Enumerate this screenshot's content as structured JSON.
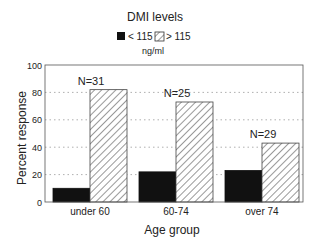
{
  "chart_data": {
    "type": "bar",
    "title": "DMI levels",
    "legend_unit": "ng/ml",
    "xlabel": "Age group",
    "ylabel": "Percent response",
    "ylim": [
      0,
      100
    ],
    "yticks": [
      0,
      20,
      40,
      60,
      80,
      100
    ],
    "grid": "horizontal dotted at 20, 40, 60, 80",
    "legend_position": "top center",
    "categories": [
      "under 60",
      "60-74",
      "over 74"
    ],
    "series": [
      {
        "name": "< 115",
        "fill": "solid",
        "color": "#111111",
        "values": [
          10,
          22,
          23
        ]
      },
      {
        "name": "> 115",
        "fill": "diagonal-hatch",
        "color": "#ffffff",
        "values": [
          82,
          73,
          43
        ]
      }
    ],
    "annotations": [
      {
        "category": "under 60",
        "text": "N=31"
      },
      {
        "category": "60-74",
        "text": "N=25"
      },
      {
        "category": "over 74",
        "text": "N=29"
      }
    ]
  },
  "colors": {
    "solid_bar": "#111111",
    "axis": "#555555",
    "grid": "#9a9a9a",
    "text": "#222222"
  }
}
